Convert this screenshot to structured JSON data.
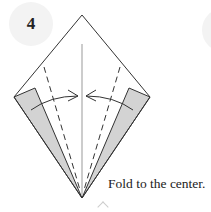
{
  "step": {
    "number": "4"
  },
  "caption": "Fold to the center.",
  "diagram": {
    "shape": "kite",
    "colors": {
      "line": "#333333",
      "flap_fill": "#d3d3d3",
      "center_line": "#888888",
      "badge_bg": "#f3f3f3"
    },
    "instruction_arrows": [
      "left-flap-to-center",
      "right-flap-to-center"
    ],
    "fold_lines": "dashed valley folds on both sides"
  },
  "icons": {
    "scroll_hint": "chevron-up-icon"
  }
}
